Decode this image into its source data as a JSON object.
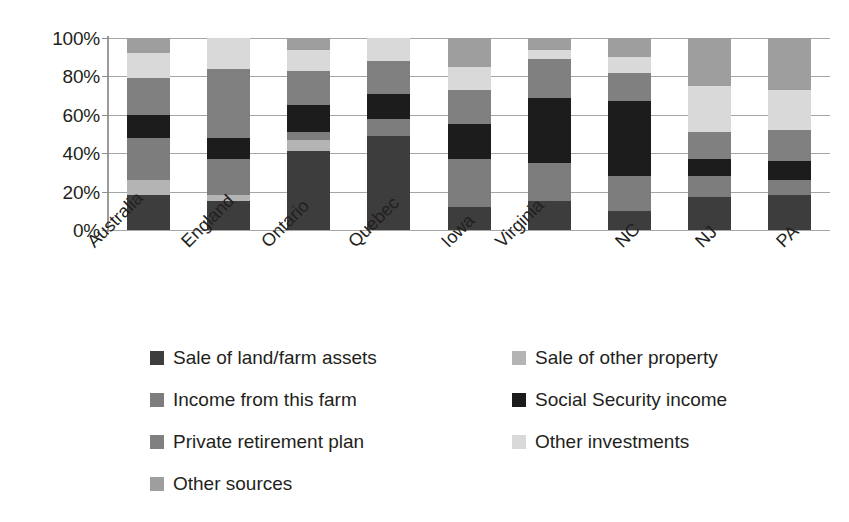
{
  "chart_data": {
    "type": "bar",
    "subtype": "stacked-100-percent",
    "title": "",
    "xlabel": "",
    "ylabel": "",
    "ylim": [
      0,
      100
    ],
    "ytick_labels": [
      "100%",
      "80%",
      "60%",
      "40%",
      "20%",
      "0%"
    ],
    "ytick_values": [
      100,
      80,
      60,
      40,
      20,
      0
    ],
    "grid": true,
    "legend_position": "bottom",
    "categories": [
      "Australia",
      "England",
      "Ontario",
      "Quebec",
      "Iowa",
      "Virginia",
      "NC",
      "NJ",
      "PA"
    ],
    "series": [
      {
        "name": "Sale of land/farm assets",
        "color": "#3d3d3d",
        "values": [
          18,
          15,
          41,
          49,
          12,
          15,
          10,
          17,
          18
        ]
      },
      {
        "name": "Sale of other property",
        "color": "#b4b4b4",
        "values": [
          8,
          3,
          6,
          0,
          0,
          0,
          0,
          0,
          0
        ]
      },
      {
        "name": "Income from this farm",
        "color": "#7d7d7d",
        "values": [
          22,
          19,
          4,
          9,
          25,
          20,
          18,
          11,
          8
        ]
      },
      {
        "name": "Social Security income",
        "color": "#1c1c1c",
        "values": [
          12,
          11,
          14,
          13,
          18,
          34,
          39,
          9,
          10
        ]
      },
      {
        "name": "Private retirement plan",
        "color": "#808080",
        "values": [
          19,
          36,
          18,
          17,
          18,
          20,
          15,
          14,
          16
        ]
      },
      {
        "name": "Other investments",
        "color": "#d9d9d9",
        "values": [
          13,
          16,
          11,
          12,
          12,
          5,
          8,
          24,
          21
        ]
      },
      {
        "name": "Other sources",
        "color": "#9e9e9e",
        "values": [
          8,
          0,
          6,
          0,
          15,
          6,
          10,
          25,
          27
        ]
      }
    ]
  },
  "axis": {
    "y_ticks": [
      {
        "label": "100%",
        "value": 100
      },
      {
        "label": "80%",
        "value": 80
      },
      {
        "label": "60%",
        "value": 60
      },
      {
        "label": "40%",
        "value": 40
      },
      {
        "label": "20%",
        "value": 20
      },
      {
        "label": "0%",
        "value": 0
      }
    ]
  },
  "legend": {
    "rows": [
      [
        {
          "label": "Sale of land/farm assets",
          "color": "#3d3d3d"
        },
        {
          "label": "Sale of other property",
          "color": "#b4b4b4"
        }
      ],
      [
        {
          "label": "Income from this farm",
          "color": "#7d7d7d"
        },
        {
          "label": "Social Security income",
          "color": "#1c1c1c"
        }
      ],
      [
        {
          "label": "Private retirement plan",
          "color": "#808080"
        },
        {
          "label": "Other investments",
          "color": "#d9d9d9"
        }
      ],
      [
        {
          "label": "Other sources",
          "color": "#9e9e9e"
        }
      ]
    ]
  }
}
